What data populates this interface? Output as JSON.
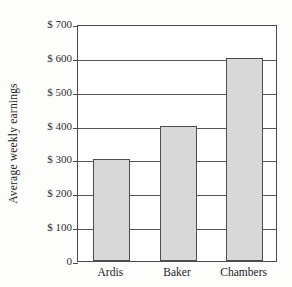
{
  "chart_data": {
    "type": "bar",
    "title": "",
    "subtitle": "",
    "xlabel": "",
    "ylabel": "Average weekly earnings",
    "categories": [
      "Ardis",
      "Baker",
      "Chambers"
    ],
    "values": [
      300,
      400,
      600
    ],
    "ylim": [
      0,
      700
    ],
    "ytick_values": [
      0,
      100,
      200,
      300,
      400,
      500,
      600,
      700
    ],
    "ytick_labels": [
      "0",
      "$ 100",
      "$ 200",
      "$ 300",
      "$ 400",
      "$ 500",
      "$ 600",
      "$ 700"
    ],
    "grid": "horizontal",
    "legend": "none",
    "series": [
      {
        "name": "Average weekly earnings",
        "values": [
          300,
          400,
          600
        ]
      }
    ],
    "annotations": [],
    "colors": {
      "bar_fill": "#d8d8d8",
      "bar_border": "#4d4d4d",
      "grid": "#555555",
      "axis": "#4a4a4a",
      "background": "#fdfdfc",
      "plot_background": "#ffffff",
      "text": "#232323"
    }
  }
}
